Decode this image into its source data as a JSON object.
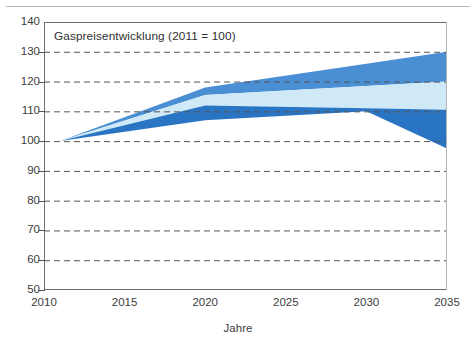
{
  "chart_data": {
    "type": "area",
    "title": "Gaspreisentwicklung (2011 = 100)",
    "xlabel": "Jahre",
    "ylabel": "",
    "xlim": [
      2010,
      2035
    ],
    "ylim": [
      50,
      140
    ],
    "grid": true,
    "grid_style": "dashed-horizontal",
    "legend": "none",
    "x_ticks": [
      2010,
      2015,
      2020,
      2025,
      2030,
      2035
    ],
    "y_ticks": [
      50,
      60,
      70,
      80,
      90,
      100,
      110,
      120,
      130,
      140
    ],
    "x": [
      2011,
      2020,
      2030,
      2035
    ],
    "series": [
      {
        "name": "upper-scenario-band",
        "role": "upper band (medium blue)",
        "color": "#4a8fd4",
        "upper_values": [
          100,
          118,
          126,
          130
        ],
        "lower_values": [
          100,
          115.5,
          118.5,
          120
        ]
      },
      {
        "name": "mid-scenario-band",
        "role": "middle band (pale blue)",
        "color": "#cfe9f7",
        "upper_values": [
          100,
          115.5,
          118.5,
          120
        ],
        "lower_values": [
          100,
          112,
          111,
          110.5
        ]
      },
      {
        "name": "lower-scenario-band",
        "role": "lower band (strong blue)",
        "color": "#2a74c4",
        "upper_values": [
          100,
          112,
          111,
          110.5
        ],
        "lower_values": [
          100,
          107,
          110,
          97.5
        ]
      }
    ],
    "colors": {
      "band_upper": "#4a8fd4",
      "band_middle": "#cfe9f7",
      "band_lower": "#2a74c4",
      "axis": "#6f6f6f",
      "gridline": "#555555",
      "text": "#3c3c3c",
      "background": "#ffffff"
    }
  },
  "axes": {
    "y_ticks": [
      "140",
      "130",
      "120",
      "110",
      "100",
      "90",
      "80",
      "70",
      "60",
      "50"
    ],
    "x_ticks": [
      "2010",
      "2015",
      "2020",
      "2025",
      "2030",
      "2035"
    ],
    "x_axis_label": "Jahre"
  },
  "title": "Gaspreisentwicklung (2011 = 100)"
}
